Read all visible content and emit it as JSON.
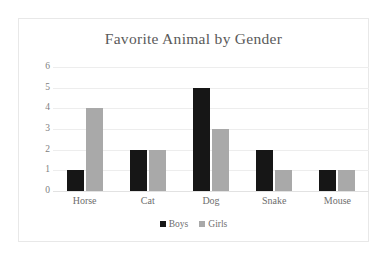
{
  "chart_data": {
    "type": "bar",
    "title": "Favorite Animal by Gender",
    "xlabel": "",
    "ylabel": "",
    "categories": [
      "Horse",
      "Cat",
      "Dog",
      "Snake",
      "Mouse"
    ],
    "series": [
      {
        "name": "Boys",
        "color": "#161616",
        "values": [
          1,
          2,
          5,
          2,
          1
        ]
      },
      {
        "name": "Girls",
        "color": "#a9a9a9",
        "values": [
          4,
          2,
          3,
          1,
          1
        ]
      }
    ],
    "ylim": [
      0,
      6
    ],
    "y_ticks": [
      0,
      1,
      2,
      3,
      4,
      5,
      6
    ],
    "y_tick_labels": [
      "0",
      "1",
      "2",
      "3",
      "4",
      "5",
      "6"
    ],
    "grid": true,
    "grid_axis": "y",
    "legend_position": "bottom",
    "title_color": "#5a5a5a",
    "tick_label_color": "#6e6e6e",
    "gridline_color": "#ededed",
    "frame_color": "#e8e8e8",
    "background_color": "#ffffff"
  }
}
